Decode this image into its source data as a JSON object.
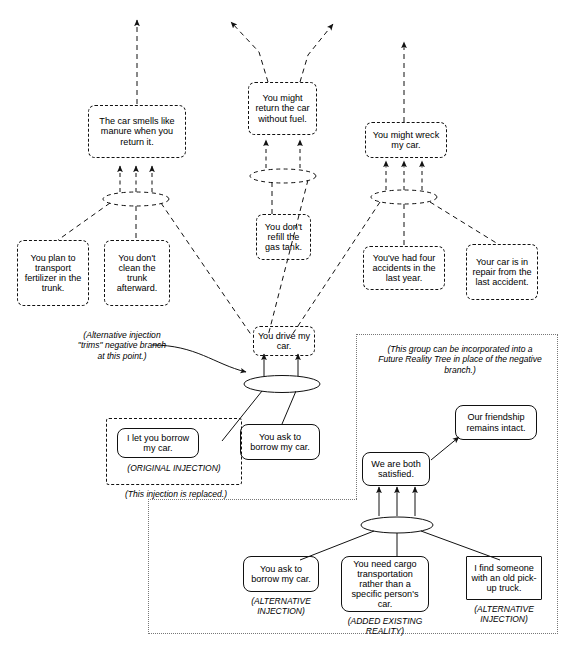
{
  "diagram": {
    "type": "logic-tree"
  },
  "nodes": {
    "car_smells": "The car smells like manure when you return it.",
    "plan_transport": "You plan to transport fertilizer in the trunk.",
    "dont_clean": "You don't clean the trunk afterward.",
    "return_no_fuel": "You might return the car without fuel.",
    "dont_refill": "You don't refill the gas tank.",
    "might_wreck": "You might wreck my car.",
    "four_accidents": "You've had four accidents in the last year.",
    "car_in_repair": "Your car is in repair from the last accident.",
    "you_drive": "You drive my car.",
    "i_let_you": "I let you borrow my car.",
    "you_ask_mid": "You ask to borrow my car.",
    "friendship": "Our friendship remains intact.",
    "both_satisfied": "We are both satisfied.",
    "you_ask_alt": "You ask to borrow my car.",
    "need_cargo": "You need cargo transportation rather than a specific person's car.",
    "pickup_truck": "I find someone with an old pick-up truck."
  },
  "annotations": {
    "alt_trims": "(Alternative injection \"trims\" negative branch at this point.)",
    "original_injection": "(ORIGINAL INJECTION)",
    "injection_replaced": "(This injection is replaced.)",
    "group_note": "(This group can be incorporated into a Future Reality Tree in place of the negative branch.)",
    "alt_injection_left": "(ALTERNATIVE INJECTION)",
    "added_existing_reality": "(ADDED EXISTING REALITY)",
    "alt_injection_right": "(ALTERNATIVE INJECTION)"
  },
  "style": {
    "line_color": "#111111",
    "background": "#ffffff",
    "group_border": "#777777"
  }
}
